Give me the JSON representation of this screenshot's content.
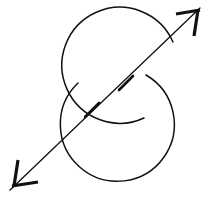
{
  "figure": {
    "canvas": {
      "width": 209,
      "height": 200,
      "background": "#ffffff"
    },
    "ink_color": "#111111",
    "elements": {
      "upper_circle": {
        "name": "upper-left-circle-arc",
        "center_x": 120,
        "center_y": 66,
        "radius": 58,
        "stroke_width": 1.5,
        "arc_path": "M 173 42 A 58 58 0 1 0 144 118"
      },
      "lower_circle": {
        "name": "lower-right-circle-arc",
        "center_x": 114,
        "center_y": 127,
        "radius": 57,
        "stroke_width": 1.5,
        "arc_path": "M 78 83 A 57 57 0 1 0 146 75"
      },
      "diagonal_arrow": {
        "name": "double-headed-diagonal-arrow",
        "start_x": 10,
        "start_y": 190,
        "end_x": 200,
        "end_y": 8,
        "stroke_width": 1.3
      },
      "arrowhead_top_right": {
        "name": "arrowhead-top-right",
        "vertex_x": 200,
        "vertex_y": 8,
        "barb_horizontal": "M 200 10 L 176 14",
        "barb_vertical": "M 198 10 L 194 36"
      },
      "arrowhead_bottom_left": {
        "name": "arrowhead-bottom-left",
        "vertex_x": 10,
        "vertex_y": 190,
        "barb_horizontal": "M 12 186 L 38 182",
        "barb_vertical": "M 14 186 L 18 160"
      },
      "tick_marks": [
        {
          "name": "tick-mark-lower",
          "path": "M 85 117 L 99 103"
        },
        {
          "name": "tick-mark-upper",
          "path": "M 119 90 L 133 76"
        }
      ]
    }
  }
}
